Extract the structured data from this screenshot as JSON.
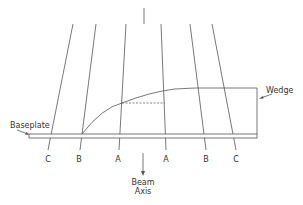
{
  "diagram": {
    "labels": {
      "baseplate": "Baseplate",
      "wedge": "Wedge",
      "beam_axis_line1": "Beam",
      "beam_axis_line2": "Axis"
    },
    "rays": [
      {
        "label": "C",
        "x1": 73,
        "y1": 24,
        "x2": 48,
        "y2": 150
      },
      {
        "label": "B",
        "x1": 96,
        "y1": 24,
        "x2": 80,
        "y2": 150
      },
      {
        "label": "A",
        "x1": 126,
        "y1": 24,
        "x2": 119,
        "y2": 150
      },
      {
        "label": "A",
        "x1": 161,
        "y1": 24,
        "x2": 166,
        "y2": 150
      },
      {
        "label": "B",
        "x1": 190,
        "y1": 24,
        "x2": 206,
        "y2": 150
      },
      {
        "label": "C",
        "x1": 212,
        "y1": 24,
        "x2": 236,
        "y2": 150
      }
    ],
    "colors": {
      "line": "#555555",
      "text": "#333333",
      "background": "#ffffff"
    }
  }
}
